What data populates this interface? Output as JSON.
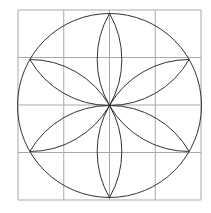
{
  "diagram": {
    "type": "flower-of-life-construction",
    "grid": {
      "x0": 18,
      "y0": 10,
      "x1": 201,
      "y1": 200,
      "cols": 4,
      "rows": 4,
      "color": "#a8a8a8"
    },
    "circle": {
      "cx": 109.5,
      "cy": 105.5,
      "r": 92,
      "color": "#333333"
    },
    "petals": 6,
    "petal_color": "#333333"
  }
}
